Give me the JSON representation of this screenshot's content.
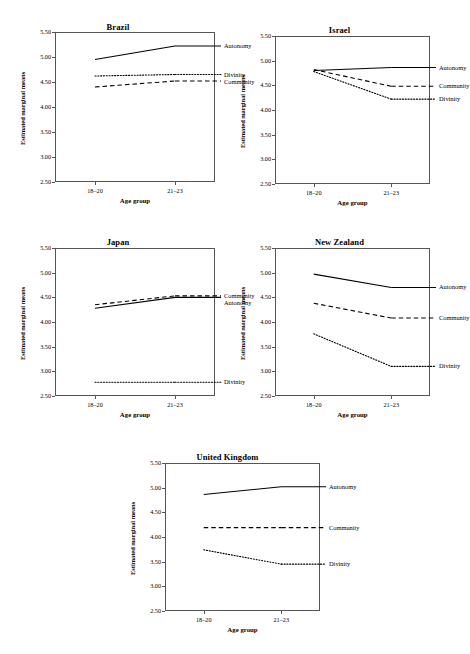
{
  "figure": {
    "axis_labels": {
      "x": "Age group",
      "y": "Estimated marginal means"
    },
    "x_categories": [
      "18–20",
      "21–23"
    ],
    "y_ticks": [
      "5.50",
      "5.00",
      "4.50",
      "4.00",
      "3.50",
      "3.00",
      "2.50"
    ],
    "series_names": {
      "autonomy": "Autonomy",
      "community": "Community",
      "divinity": "Divinity"
    },
    "panel_titles": {
      "brazil": "Brazil",
      "israel": "Israel",
      "japan": "Japan",
      "new_zealand": "New Zealand",
      "united_kingdom": "United Kingdom"
    }
  },
  "chart_data": [
    {
      "type": "line",
      "title": "Brazil",
      "xlabel": "Age group",
      "ylabel": "Estimated marginal means",
      "categories": [
        "18–20",
        "21–23"
      ],
      "ylim": [
        2.5,
        5.5
      ],
      "yticks": [
        2.5,
        3.0,
        3.5,
        4.0,
        4.5,
        5.0,
        5.5
      ],
      "grid": false,
      "legend": "inline-right",
      "series": [
        {
          "name": "Autonomy",
          "style": "solid",
          "values": [
            4.95,
            5.22
          ]
        },
        {
          "name": "Divinity",
          "style": "dotted",
          "values": [
            4.62,
            4.65
          ]
        },
        {
          "name": "Community",
          "style": "dashed",
          "values": [
            4.4,
            4.52
          ]
        }
      ]
    },
    {
      "type": "line",
      "title": "Israel",
      "xlabel": "Age group",
      "ylabel": "Estimated marginal means",
      "categories": [
        "18–20",
        "21–23"
      ],
      "ylim": [
        2.5,
        5.5
      ],
      "yticks": [
        2.5,
        3.0,
        3.5,
        4.0,
        4.5,
        5.0,
        5.5
      ],
      "grid": false,
      "legend": "inline-right",
      "series": [
        {
          "name": "Autonomy",
          "style": "solid",
          "values": [
            4.8,
            4.86
          ]
        },
        {
          "name": "Community",
          "style": "dashed",
          "values": [
            4.82,
            4.48
          ]
        },
        {
          "name": "Divinity",
          "style": "dotted",
          "values": [
            4.78,
            4.22
          ]
        }
      ]
    },
    {
      "type": "line",
      "title": "Japan",
      "xlabel": "Age group",
      "ylabel": "Estimated marginal means",
      "categories": [
        "18–20",
        "21–23"
      ],
      "ylim": [
        2.5,
        5.5
      ],
      "yticks": [
        2.5,
        3.0,
        3.5,
        4.0,
        4.5,
        5.0,
        5.5
      ],
      "grid": false,
      "legend": "inline-right",
      "series": [
        {
          "name": "Community",
          "style": "dashed",
          "values": [
            4.35,
            4.53
          ]
        },
        {
          "name": "Autonomy",
          "style": "solid",
          "values": [
            4.28,
            4.5
          ]
        },
        {
          "name": "Divinity",
          "style": "dotted",
          "values": [
            2.78,
            2.78
          ]
        }
      ]
    },
    {
      "type": "line",
      "title": "New Zealand",
      "xlabel": "Age group",
      "ylabel": "Estimated marginal means",
      "categories": [
        "18–20",
        "21–23"
      ],
      "ylim": [
        2.5,
        5.5
      ],
      "yticks": [
        2.5,
        3.0,
        3.5,
        4.0,
        4.5,
        5.0,
        5.5
      ],
      "grid": false,
      "legend": "inline-right",
      "series": [
        {
          "name": "Autonomy",
          "style": "solid",
          "values": [
            4.97,
            4.7
          ]
        },
        {
          "name": "Community",
          "style": "dashed",
          "values": [
            4.38,
            4.08
          ]
        },
        {
          "name": "Divinity",
          "style": "dotted",
          "values": [
            3.76,
            3.1
          ]
        }
      ]
    },
    {
      "type": "line",
      "title": "United Kingdom",
      "xlabel": "Age group",
      "ylabel": "Estimated marginal means",
      "categories": [
        "18–20",
        "21–23"
      ],
      "ylim": [
        2.5,
        5.5
      ],
      "yticks": [
        2.5,
        3.0,
        3.5,
        4.0,
        4.5,
        5.0,
        5.5
      ],
      "grid": false,
      "legend": "inline-right",
      "series": [
        {
          "name": "Autonomy",
          "style": "solid",
          "values": [
            4.86,
            5.02
          ]
        },
        {
          "name": "Community",
          "style": "dashed",
          "values": [
            4.19,
            4.19
          ]
        },
        {
          "name": "Divinity",
          "style": "dotted",
          "values": [
            3.74,
            3.45
          ]
        }
      ]
    }
  ]
}
